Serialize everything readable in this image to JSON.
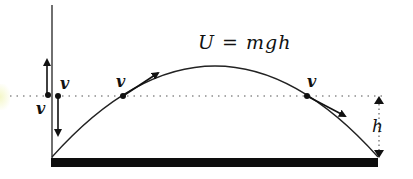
{
  "diagram": {
    "type": "projectile-energy",
    "equation": "U = mgh",
    "labels": {
      "v_up_left": "v",
      "v_down": "v",
      "v_rising": "v",
      "v_falling": "v",
      "height": "h"
    },
    "colors": {
      "ink": "#111111",
      "ground": "#0d0d0d",
      "background": "#ffffff",
      "dotted_line": "#555555"
    }
  }
}
